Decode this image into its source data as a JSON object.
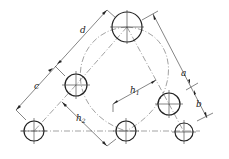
{
  "diagram": {
    "type": "hole-pattern-dimension-drawing",
    "labels": {
      "d": "d",
      "c": "c",
      "a": "a",
      "b": "b",
      "h1": "h",
      "h1_sub": "1",
      "h2": "h",
      "h2_sub": "2"
    },
    "holes": [
      {
        "id": "top",
        "cx": 127,
        "cy": 27,
        "r": 15
      },
      {
        "id": "left-mid",
        "cx": 76,
        "cy": 85,
        "r": 11
      },
      {
        "id": "bottom-left",
        "cx": 34,
        "cy": 131,
        "r": 10
      },
      {
        "id": "bottom-center",
        "cx": 126,
        "cy": 131,
        "r": 10
      },
      {
        "id": "right-mid",
        "cx": 169,
        "cy": 104,
        "r": 11
      },
      {
        "id": "bottom-right",
        "cx": 184,
        "cy": 132,
        "r": 9
      }
    ],
    "colors": {
      "line": "#222222",
      "background": "#ffffff"
    }
  }
}
